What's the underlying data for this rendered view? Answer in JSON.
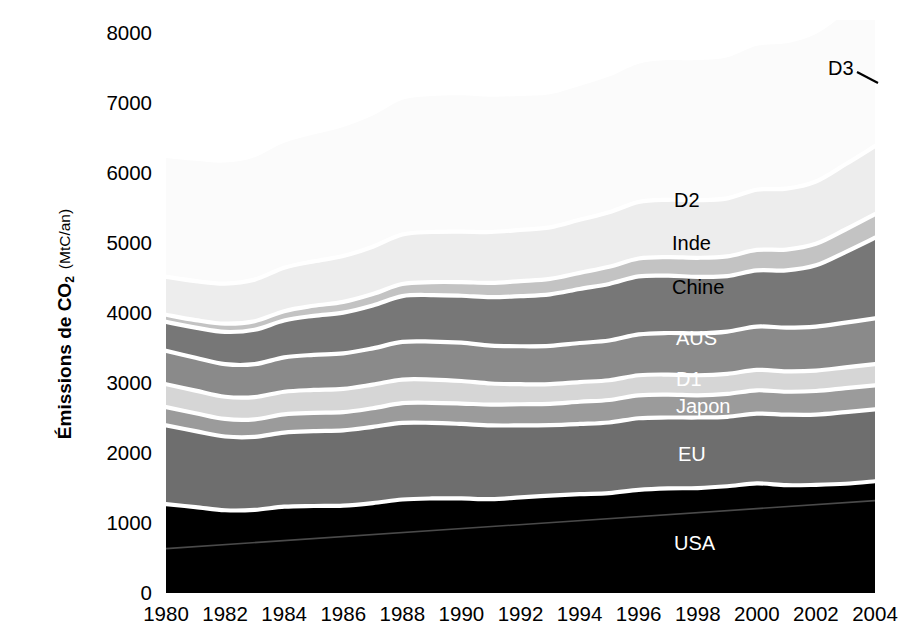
{
  "axes": {
    "y_label_main": "Émissions de CO",
    "y_label_sub": "2",
    "y_label_unit": "(MtC/an)",
    "y_ticks": [
      "8000",
      "7000",
      "6000",
      "5000",
      "4000",
      "3000",
      "2000",
      "1000",
      "0"
    ],
    "x_ticks": [
      "1980",
      "1982",
      "1984",
      "1986",
      "1988",
      "1990",
      "1992",
      "1994",
      "1996",
      "1998",
      "2000",
      "2002",
      "2004"
    ]
  },
  "series_labels": {
    "d3": "D3",
    "d2": "D2",
    "inde": "Inde",
    "chine": "Chine",
    "aus": "AUS",
    "d1": "D1",
    "japon": "Japon",
    "eu": "EU",
    "usa": "USA"
  },
  "colors": {
    "usa": "#000000",
    "eu": "#6e6e6e",
    "japon": "#9b9b9b",
    "d1": "#d6d6d6",
    "aus": "#8a8a8a",
    "chine": "#777777",
    "inde": "#c3c3c3",
    "d2": "#ededed",
    "d3": "#fbfbfb",
    "separator": "#ffffff",
    "text_dark": "#000000",
    "text_light": "#ffffff"
  },
  "chart_data": {
    "type": "area",
    "title": "",
    "xlabel": "",
    "ylabel": "Émissions de CO2 (MtC/an)",
    "xlim": [
      1980,
      2004
    ],
    "ylim": [
      0,
      8000
    ],
    "ytick_step": 1000,
    "grid": false,
    "legend": "inline-labels",
    "stacked": true,
    "x": [
      1980,
      1981,
      1982,
      1983,
      1984,
      1985,
      1986,
      1987,
      1988,
      1989,
      1990,
      1991,
      1992,
      1993,
      1994,
      1995,
      1996,
      1997,
      1998,
      1999,
      2000,
      2001,
      2002,
      2003,
      2004
    ],
    "series": [
      {
        "name": "USA",
        "values": [
          1240,
          1200,
          1155,
          1160,
          1205,
          1215,
          1220,
          1255,
          1305,
          1320,
          1320,
          1310,
          1335,
          1360,
          1380,
          1395,
          1440,
          1460,
          1465,
          1490,
          1530,
          1505,
          1510,
          1525,
          1560
        ]
      },
      {
        "name": "EU",
        "values": [
          1100,
          1060,
          1030,
          1020,
          1035,
          1045,
          1050,
          1065,
          1070,
          1055,
          1040,
          1030,
          1005,
          985,
          980,
          985,
          1000,
          990,
          985,
          970,
          975,
          985,
          980,
          1000,
          1005
        ]
      },
      {
        "name": "Japon",
        "values": [
          255,
          250,
          245,
          245,
          255,
          255,
          255,
          260,
          275,
          280,
          285,
          290,
          295,
          295,
          310,
          315,
          320,
          320,
          310,
          320,
          325,
          320,
          330,
          335,
          335
        ]
      },
      {
        "name": "D1",
        "values": [
          320,
          315,
          310,
          310,
          315,
          320,
          325,
          330,
          330,
          325,
          315,
          295,
          280,
          275,
          275,
          275,
          280,
          280,
          280,
          280,
          285,
          285,
          285,
          290,
          295
        ]
      },
      {
        "name": "AUS",
        "values": [
          465,
          460,
          455,
          460,
          480,
          490,
          495,
          505,
          525,
          530,
          535,
          530,
          530,
          535,
          545,
          555,
          570,
          580,
          585,
          590,
          605,
          610,
          615,
          625,
          640
        ]
      },
      {
        "name": "Chine",
        "values": [
          405,
          420,
          450,
          480,
          515,
          545,
          570,
          600,
          640,
          650,
          655,
          675,
          700,
          720,
          755,
          790,
          810,
          800,
          790,
          775,
          785,
          800,
          855,
          985,
          1125
        ]
      },
      {
        "name": "Inde",
        "values": [
          100,
          105,
          115,
          120,
          130,
          140,
          150,
          160,
          170,
          180,
          190,
          200,
          210,
          215,
          225,
          240,
          250,
          260,
          265,
          275,
          285,
          290,
          300,
          315,
          330
        ]
      },
      {
        "name": "D2",
        "values": [
          530,
          545,
          560,
          580,
          605,
          620,
          640,
          660,
          690,
          700,
          705,
          710,
          715,
          720,
          740,
          760,
          790,
          800,
          805,
          810,
          840,
          850,
          870,
          910,
          950
        ]
      },
      {
        "name": "D3",
        "values": [
          1660,
          1680,
          1690,
          1710,
          1745,
          1770,
          1800,
          1830,
          1880,
          1900,
          1905,
          1890,
          1870,
          1860,
          1870,
          1895,
          1930,
          1950,
          1955,
          1970,
          2010,
          2030,
          2060,
          2110,
          2170
        ]
      }
    ],
    "totals": [
      6075,
      6035,
      6010,
      6085,
      6285,
      6400,
      6505,
      6665,
      6885,
      6940,
      6960,
      6930,
      6940,
      6965,
      7080,
      7210,
      7390,
      7440,
      7440,
      7480,
      7640,
      7675,
      7805,
      8095,
      8410
    ]
  }
}
